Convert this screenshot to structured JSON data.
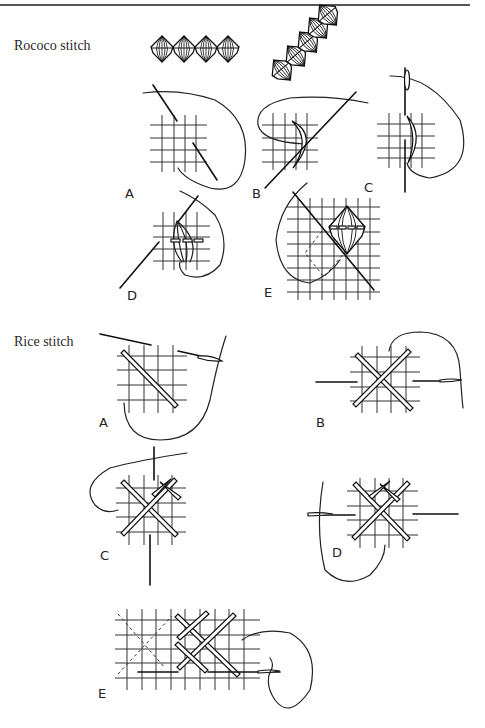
{
  "page": {
    "sections": [
      {
        "title": "Rococo stitch",
        "figures": [
          "A",
          "B",
          "C",
          "D",
          "E"
        ]
      },
      {
        "title": "Rice stitch",
        "figures": [
          "A",
          "B",
          "C",
          "D",
          "E"
        ]
      }
    ]
  }
}
